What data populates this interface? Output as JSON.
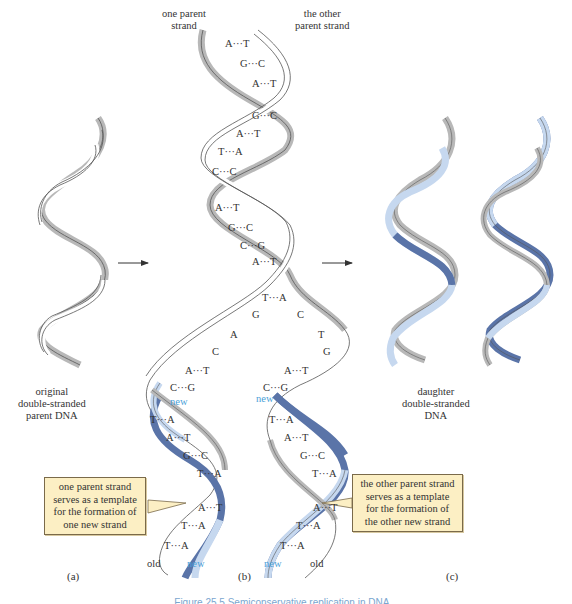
{
  "labels": {
    "one_parent_strand": [
      "one parent",
      "strand"
    ],
    "other_parent_strand": [
      "the other",
      "parent strand"
    ],
    "original": [
      "original",
      "double-stranded",
      "parent DNA"
    ],
    "daughter": [
      "daughter",
      "double-stranded",
      "DNA"
    ],
    "new": "new",
    "old": "old"
  },
  "callouts": {
    "left": [
      "one parent strand",
      "serves as a template",
      "for the formation of",
      "one new strand"
    ],
    "right": [
      "the other parent strand",
      "serves as a template",
      "for the formation of",
      "the other new strand"
    ]
  },
  "panels": {
    "a": "(a)",
    "b": "(b)",
    "c": "(c)"
  },
  "base_pairs_top": [
    {
      "pair": "A···T"
    },
    {
      "pair": "G···C"
    },
    {
      "pair": "A···T"
    },
    {
      "pair": "G···C"
    },
    {
      "pair": "A···T"
    },
    {
      "pair": "T···A"
    },
    {
      "pair": "C···C"
    },
    {
      "pair": "A···T"
    },
    {
      "pair": "G···C"
    },
    {
      "pair": "C···G"
    },
    {
      "pair": "A···T"
    },
    {
      "pair": "T···A"
    }
  ],
  "unpaired_left": [
    "G",
    "A",
    "C"
  ],
  "unpaired_right": [
    "C",
    "T",
    "G"
  ],
  "pairs_split_left": [
    "A···T",
    "C···G"
  ],
  "pairs_split_right": [
    "A···T",
    "C···G"
  ],
  "bottom_left_pairs": [
    "T···A",
    "A···T",
    "G···C",
    "T···A",
    "A···T",
    "T···A",
    "T···A"
  ],
  "bottom_right_pairs": [
    "T···A",
    "A···T",
    "G···C",
    "T···A",
    "A···T",
    "T···A",
    "T···A"
  ],
  "colors": {
    "old_strand": "#b8b8b8",
    "outline": "#555555",
    "new_strand_dark": "#5a74a8",
    "new_strand_light": "#c6d8ef",
    "new_label": "#4a9fd8",
    "callout_fill": "#fcefc4"
  },
  "caption": "Figure 25.5 Semiconservative replication in DNA..."
}
